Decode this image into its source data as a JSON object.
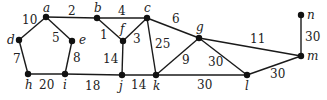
{
  "graph": {
    "nodes": [
      {
        "id": "a",
        "label": "a",
        "x": 46,
        "y": 17,
        "lx": 43,
        "ly": 12
      },
      {
        "id": "b",
        "label": "b",
        "x": 97,
        "y": 18,
        "lx": 94,
        "ly": 12
      },
      {
        "id": "c",
        "label": "c",
        "x": 147,
        "y": 18,
        "lx": 144,
        "ly": 12
      },
      {
        "id": "d",
        "label": "d",
        "x": 19,
        "y": 40,
        "lx": 7,
        "ly": 44
      },
      {
        "id": "e",
        "label": "e",
        "x": 72,
        "y": 41,
        "lx": 79,
        "ly": 44
      },
      {
        "id": "f",
        "label": "f",
        "x": 123,
        "y": 41,
        "lx": 120,
        "ly": 33
      },
      {
        "id": "g",
        "label": "g",
        "x": 199,
        "y": 38,
        "lx": 196,
        "ly": 31
      },
      {
        "id": "h",
        "label": "h",
        "x": 28,
        "y": 74,
        "lx": 25,
        "ly": 89
      },
      {
        "id": "i",
        "label": "i",
        "x": 65,
        "y": 74,
        "lx": 63,
        "ly": 89
      },
      {
        "id": "j",
        "label": "j",
        "x": 122,
        "y": 75,
        "lx": 119,
        "ly": 90
      },
      {
        "id": "k",
        "label": "k",
        "x": 156,
        "y": 75,
        "lx": 153,
        "ly": 90
      },
      {
        "id": "l",
        "label": "l",
        "x": 247,
        "y": 75,
        "lx": 245,
        "ly": 90
      },
      {
        "id": "m",
        "label": "m",
        "x": 301,
        "y": 56,
        "lx": 307,
        "ly": 60
      },
      {
        "id": "n",
        "label": "n",
        "x": 301,
        "y": 15,
        "lx": 307,
        "ly": 19
      }
    ],
    "edges": [
      {
        "from": "a",
        "to": "b",
        "weight": "2",
        "wx": 68,
        "wy": 15
      },
      {
        "from": "a",
        "to": "d",
        "weight": "10",
        "wx": 22,
        "wy": 24
      },
      {
        "from": "a",
        "to": "e",
        "weight": "5",
        "wx": 52,
        "wy": 42
      },
      {
        "from": "d",
        "to": "h",
        "weight": "7",
        "wx": 13,
        "wy": 63
      },
      {
        "from": "e",
        "to": "i",
        "weight": "8",
        "wx": 73,
        "wy": 62
      },
      {
        "from": "h",
        "to": "i",
        "weight": "20",
        "wx": 39,
        "wy": 89
      },
      {
        "from": "i",
        "to": "j",
        "weight": "18",
        "wx": 85,
        "wy": 90
      },
      {
        "from": "b",
        "to": "c",
        "weight": "4",
        "wx": 118,
        "wy": 15
      },
      {
        "from": "b",
        "to": "f",
        "weight": "1",
        "wx": 100,
        "wy": 39
      },
      {
        "from": "c",
        "to": "f",
        "weight": "3",
        "wx": 133,
        "wy": 43
      },
      {
        "from": "f",
        "to": "j",
        "weight": "14",
        "wx": 103,
        "wy": 63
      },
      {
        "from": "j",
        "to": "k",
        "weight": "14",
        "wx": 131,
        "wy": 89
      },
      {
        "from": "c",
        "to": "k",
        "weight": "25",
        "wx": 155,
        "wy": 48
      },
      {
        "from": "c",
        "to": "g",
        "weight": "6",
        "wx": 172,
        "wy": 23
      },
      {
        "from": "g",
        "to": "k",
        "weight": "9",
        "wx": 182,
        "wy": 64
      },
      {
        "from": "k",
        "to": "l",
        "weight": "30",
        "wx": 197,
        "wy": 89
      },
      {
        "from": "g",
        "to": "l",
        "weight": "30",
        "wx": 208,
        "wy": 66
      },
      {
        "from": "g",
        "to": "m",
        "weight": "11",
        "wx": 250,
        "wy": 43
      },
      {
        "from": "l",
        "to": "m",
        "weight": "30",
        "wx": 270,
        "wy": 78
      },
      {
        "from": "m",
        "to": "n",
        "weight": "30",
        "wx": 305,
        "wy": 41
      }
    ]
  }
}
